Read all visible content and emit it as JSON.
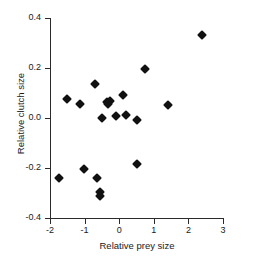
{
  "chart_data": {
    "type": "scatter",
    "title": "",
    "xlabel": "Relative prey size",
    "ylabel": "Relative clutch size",
    "xlim": [
      -2,
      3
    ],
    "ylim": [
      -0.4,
      0.4
    ],
    "xticks": [
      -2,
      -1,
      0,
      1,
      2,
      3
    ],
    "xticklabels": [
      "-2",
      "-1",
      "0",
      "1",
      "2",
      "3"
    ],
    "yticks": [
      -0.4,
      -0.2,
      0.0,
      0.2,
      0.4
    ],
    "yticklabels": [
      "-0.4",
      "-0.2",
      "0.0",
      "0.2",
      "0.4"
    ],
    "grid": false,
    "legend": null,
    "marker": "diamond",
    "marker_color": "#111111",
    "points": [
      {
        "x": -1.73,
        "y": -0.24
      },
      {
        "x": -1.5,
        "y": 0.075
      },
      {
        "x": -1.14,
        "y": 0.055
      },
      {
        "x": -1.02,
        "y": -0.205
      },
      {
        "x": -0.7,
        "y": 0.135
      },
      {
        "x": -0.63,
        "y": -0.24
      },
      {
        "x": -0.56,
        "y": -0.295
      },
      {
        "x": -0.55,
        "y": -0.31
      },
      {
        "x": -0.5,
        "y": 0.0
      },
      {
        "x": -0.36,
        "y": 0.065
      },
      {
        "x": -0.31,
        "y": 0.055
      },
      {
        "x": -0.28,
        "y": 0.068
      },
      {
        "x": -0.08,
        "y": 0.008
      },
      {
        "x": 0.12,
        "y": 0.093
      },
      {
        "x": 0.2,
        "y": 0.013
      },
      {
        "x": 0.5,
        "y": -0.007
      },
      {
        "x": 0.52,
        "y": -0.183
      },
      {
        "x": 0.75,
        "y": 0.195
      },
      {
        "x": 1.41,
        "y": 0.053
      },
      {
        "x": 2.4,
        "y": 0.332
      }
    ]
  }
}
